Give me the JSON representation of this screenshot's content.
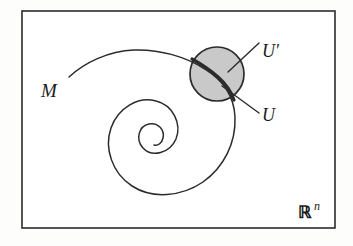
{
  "figure": {
    "title_alt": "Manifold M with chart neighborhood U and open set U' in R^n",
    "frame": {
      "x": 22,
      "y": 11,
      "width": 313,
      "height": 217,
      "stroke": "#2b2b2b",
      "stroke_width": 1.6,
      "fill": "#ffffff"
    },
    "labels": {
      "manifold": "M",
      "chart_open": "U",
      "ambient_open": "U′",
      "space_symbol": "ℝ",
      "space_exponent": "n"
    },
    "label_positions": {
      "manifold": {
        "x": 41,
        "y": 97
      },
      "ambient_open": {
        "x": 262,
        "y": 57
      },
      "chart_open": {
        "x": 262,
        "y": 121
      },
      "space_symbol": {
        "x": 299,
        "y": 218
      },
      "space_exponent": {
        "x": 317,
        "y": 211
      }
    },
    "disc": {
      "name": "shaded-neighborhood-disc",
      "cx": 217,
      "cy": 74,
      "r": 27,
      "fill": "#c9c9c9",
      "stroke": "#2b2b2b",
      "stroke_width": 1.7
    },
    "curve": {
      "name": "spiral-curve-M",
      "stroke": "#2b2b2b",
      "stroke_width": 1.5,
      "highlight_stroke_width": 3.2,
      "description": "Arc from lower-left rising to apex then descending into disc and spiralling inward clockwise to a center point"
    },
    "leaders": [
      {
        "name": "leader-to-ambient-open",
        "x1": 228,
        "y1": 72,
        "x2": 259,
        "y2": 43
      },
      {
        "name": "leader-to-chart-open",
        "x1": 224,
        "y1": 88,
        "x2": 259,
        "y2": 113
      }
    ],
    "colors": {
      "ink": "#2b2b2b",
      "shade": "#c9c9c9",
      "paper": "#fdfdfc",
      "ghost_text": "#d9d6d0"
    },
    "ghost_text": {
      "line1": "a b c d e f g  h i j k l m",
      "line2": "( x )  ( y )",
      "line3": "( f ( x ) )",
      "line4": "u v w"
    }
  }
}
